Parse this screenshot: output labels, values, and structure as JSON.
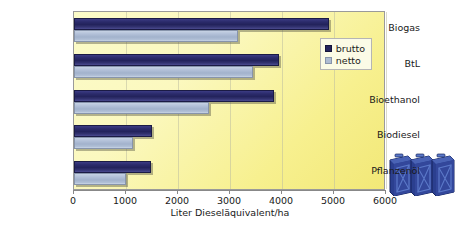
{
  "chart_data": {
    "type": "bar",
    "orientation": "horizontal",
    "title": "",
    "xlabel": "Liter Dieseläquivalent/ha",
    "ylabel": "",
    "xlim": [
      0,
      6000
    ],
    "xticks": [
      0,
      1000,
      2000,
      3000,
      4000,
      5000,
      6000
    ],
    "categories": [
      "Biogas",
      "BtL",
      "Bioethanol",
      "Biodiesel",
      "Pflanzenöl"
    ],
    "series": [
      {
        "name": "brutto",
        "color": "#23235c",
        "values": [
          4900,
          3950,
          3850,
          1500,
          1480
        ]
      },
      {
        "name": "netto",
        "color": "#aebcd3",
        "values": [
          3150,
          3450,
          2600,
          1130,
          1000
        ]
      }
    ],
    "grid": true,
    "legend_position": "top-right"
  },
  "legend": {
    "items": [
      {
        "label": "brutto"
      },
      {
        "label": "netto"
      }
    ]
  },
  "decoration": {
    "jerrycans": {
      "count": 3,
      "body_color": "#2b3f8f",
      "highlight_color": "#5b78c8"
    }
  }
}
